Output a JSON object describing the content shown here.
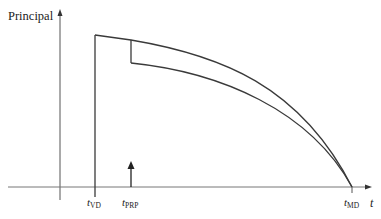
{
  "diagram": {
    "y_axis_label": "Principal",
    "x_axis_label": "t",
    "ticks": [
      {
        "main": "t",
        "sub": "VD"
      },
      {
        "main": "t",
        "sub": "PRP"
      },
      {
        "main": "t",
        "sub": "MD"
      }
    ],
    "curves": [
      "original principal balance",
      "principal after partial prepayment"
    ],
    "colors": {
      "line": "#3a3a3a",
      "axis": "#555555"
    }
  }
}
